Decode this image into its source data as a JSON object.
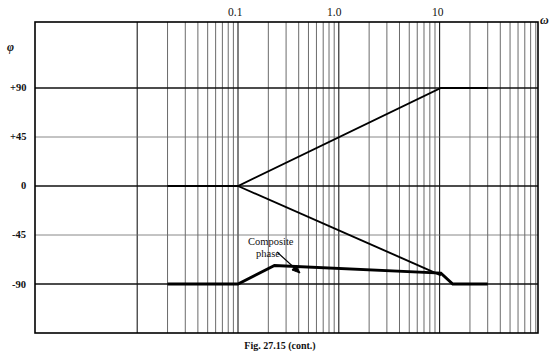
{
  "figure": {
    "caption": "Fig. 27.15 (cont.)",
    "y_axis_name": "φ",
    "x_axis_name": "ω"
  },
  "chart_data": {
    "type": "line",
    "title": "",
    "xlabel": "ω",
    "ylabel": "φ",
    "xscale": "log",
    "xlim": [
      0.02,
      30
    ],
    "ylim": [
      -110,
      110
    ],
    "grid": true,
    "grid_style": "semilog-graph-paper",
    "legend": "none",
    "xtick_labels": [
      "0.1",
      "1.0",
      "10"
    ],
    "xtick_values": [
      0.1,
      1.0,
      10
    ],
    "ytick_labels": [
      "+90",
      "+45",
      "0",
      "-45",
      "-90"
    ],
    "ytick_values": [
      90,
      45,
      0,
      -45,
      -90
    ],
    "annotations": [
      {
        "text": "Composite phase",
        "line1": "Composite",
        "line2": "phase",
        "arrow": "down-right"
      }
    ],
    "series": [
      {
        "name": "lead-phase-asymptote",
        "points": [
          [
            0.02,
            0
          ],
          [
            0.1,
            0
          ],
          [
            10.3,
            90
          ],
          [
            30,
            90
          ]
        ]
      },
      {
        "name": "lag-phase-asymptote",
        "points": [
          [
            0.1,
            0
          ],
          [
            10.3,
            -82
          ]
        ]
      },
      {
        "name": "composite-phase",
        "emphasis": "thick",
        "points": [
          [
            0.02,
            -90
          ],
          [
            0.1,
            -90
          ],
          [
            0.23,
            -73
          ],
          [
            10.3,
            -80
          ],
          [
            13.5,
            -90
          ],
          [
            30,
            -90
          ]
        ]
      }
    ]
  }
}
